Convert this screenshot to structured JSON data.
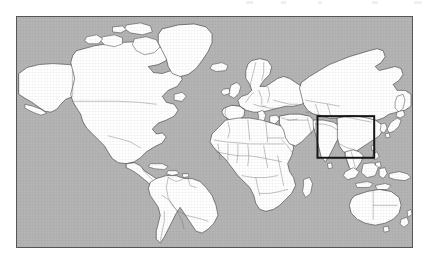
{
  "figure": {
    "type": "world-map",
    "projection": "equirectangular",
    "frame": {
      "x": 16,
      "y": 16,
      "width": 397,
      "height": 232
    },
    "colors": {
      "ocean": "#b4b4b4",
      "land": "#ffffff",
      "coastline": "#2b2b2b",
      "country_border": "#6d6d6d",
      "frame_border": "#55565a",
      "highlight_box": "#141414",
      "page_background": "#ffffff"
    }
  },
  "highlight": {
    "name": "east-southeast-asia-region",
    "label": "",
    "box_px": {
      "x": 318,
      "y": 116,
      "width": 57,
      "height": 42
    },
    "stroke": "#141414",
    "stroke_width": 2
  },
  "regions": [
    {
      "name": "north-america"
    },
    {
      "name": "south-america"
    },
    {
      "name": "greenland"
    },
    {
      "name": "europe"
    },
    {
      "name": "africa"
    },
    {
      "name": "asia"
    },
    {
      "name": "australia"
    },
    {
      "name": "new-zealand"
    },
    {
      "name": "japan"
    },
    {
      "name": "indonesia"
    },
    {
      "name": "philippines"
    },
    {
      "name": "madagascar"
    },
    {
      "name": "iceland"
    },
    {
      "name": "british-isles"
    },
    {
      "name": "sri-lanka"
    },
    {
      "name": "new-guinea"
    }
  ],
  "artifacts": [
    {
      "x": 246,
      "width": 7
    },
    {
      "x": 281,
      "width": 5
    },
    {
      "x": 318,
      "width": 4
    },
    {
      "x": 372,
      "width": 6
    },
    {
      "x": 414,
      "width": 8
    }
  ]
}
